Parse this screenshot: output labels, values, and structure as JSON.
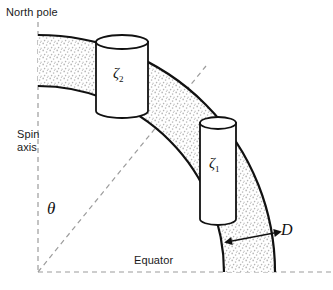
{
  "figure": {
    "type": "technical-diagram",
    "width": 333,
    "height": 290,
    "background": "#ffffff"
  },
  "labels": {
    "north_pole": "North pole",
    "spin_axis": "Spin\naxis",
    "equator": "Equator",
    "theta": "θ",
    "thickness": "D",
    "zeta2_base": "ζ",
    "zeta2_sub": "2",
    "zeta1_base": "ζ",
    "zeta1_sub": "1"
  },
  "colors": {
    "stroke": "#111111",
    "dashed": "#9a9a9a",
    "stipple_dot": "#b4b4b4",
    "fill": "#ffffff",
    "text": "#1a1a1a"
  },
  "geometry": {
    "origin": [
      38,
      272
    ],
    "outer_radius": 237,
    "inner_radius": 186,
    "shell_thickness_px": 51,
    "axis_top": [
      38,
      22
    ],
    "equator_right": [
      330,
      272
    ],
    "radius_line_end": [
      206,
      66
    ],
    "theta_angle_deg": 42
  },
  "cylinders": [
    {
      "name": "zeta2",
      "label": "ζ₂",
      "top_ellipse_center": [
        122,
        42
      ],
      "rx": 26,
      "ry": 7,
      "height": 68,
      "tilt_deg": 0
    },
    {
      "name": "zeta1",
      "label": "ζ₁",
      "top_ellipse_center": [
        218,
        123
      ],
      "rx": 18,
      "ry": 6,
      "height": 95,
      "tilt_deg": 0
    }
  ],
  "annotations": {
    "thickness_arrow": {
      "label": "D",
      "from": [
        232,
        240
      ],
      "to": [
        275,
        233
      ],
      "double_headed": true
    }
  }
}
